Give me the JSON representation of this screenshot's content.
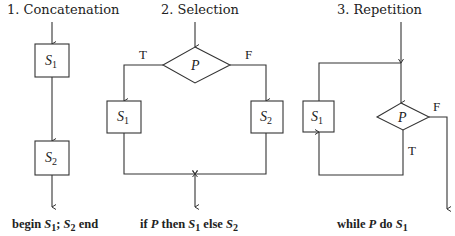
{
  "panels": [
    {
      "title": "1. Concatenation",
      "blocks": [
        {
          "sym": "S",
          "sub": "1"
        },
        {
          "sym": "S",
          "sub": "2"
        }
      ],
      "caption": {
        "pre": "begin ",
        "s1": "S",
        "s1sub": "1",
        "mid": "; ",
        "s2": "S",
        "s2sub": "2",
        "post": " end"
      }
    },
    {
      "title": "2. Selection",
      "decision": {
        "sym": "P"
      },
      "true_label": "T",
      "false_label": "F",
      "blocks": [
        {
          "sym": "S",
          "sub": "1"
        },
        {
          "sym": "S",
          "sub": "2"
        }
      ],
      "caption": {
        "pre": "if ",
        "p": "P",
        "then": " then ",
        "s1": "S",
        "s1sub": "1",
        "else": " else ",
        "s2": "S",
        "s2sub": "2"
      }
    },
    {
      "title": "3. Repetition",
      "decision": {
        "sym": "P"
      },
      "true_label": "T",
      "false_label": "F",
      "blocks": [
        {
          "sym": "S",
          "sub": "1"
        }
      ],
      "caption": {
        "pre": "while ",
        "p": "P",
        "do": " do ",
        "s1": "S",
        "s1sub": "1"
      }
    }
  ]
}
